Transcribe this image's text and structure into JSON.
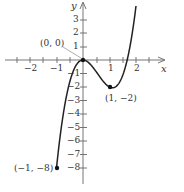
{
  "chart_data": {
    "type": "line",
    "title": "",
    "xlabel": "x",
    "ylabel": "y",
    "function_fit": "y = 3x^3 - 5x^2",
    "x": [
      -1,
      -0.75,
      -0.5,
      -0.25,
      0,
      0.25,
      0.5,
      0.75,
      1,
      1.25,
      1.5,
      1.75,
      1.95
    ],
    "y": [
      -8,
      -4.08,
      -1.63,
      -0.36,
      0,
      -0.27,
      -0.88,
      -1.55,
      -2,
      -1.95,
      -1.13,
      0.77,
      3.23
    ],
    "xlim": [
      -2.9,
      3.1
    ],
    "ylim": [
      -9,
      4.4
    ],
    "x_ticks": [
      -2,
      -1,
      1,
      2
    ],
    "x_minor_tick_step": 0.5,
    "y_ticks": [
      -8,
      -7,
      -6,
      -5,
      -4,
      -3,
      -2,
      -1,
      1,
      2,
      3
    ],
    "grid": false,
    "annotations": [
      {
        "label": "(0, 0)",
        "x": 0,
        "y": 0
      },
      {
        "label": "(1, −2)",
        "x": 1,
        "y": -2
      },
      {
        "label": "(−1, −8)",
        "x": -1,
        "y": -8
      }
    ],
    "series_color": "#222222"
  },
  "labels": {
    "x_axis": "x",
    "y_axis": "y",
    "x_ticks": [
      "−2",
      "−1",
      "1",
      "2"
    ],
    "y_ticks": [
      "3",
      "2",
      "1",
      "−1",
      "−2",
      "−3",
      "−4",
      "−5",
      "−6",
      "−7",
      "−8"
    ],
    "pt_origin": "(0, 0)",
    "pt_min": "(1, −2)",
    "pt_start": "(−1, −8)"
  }
}
